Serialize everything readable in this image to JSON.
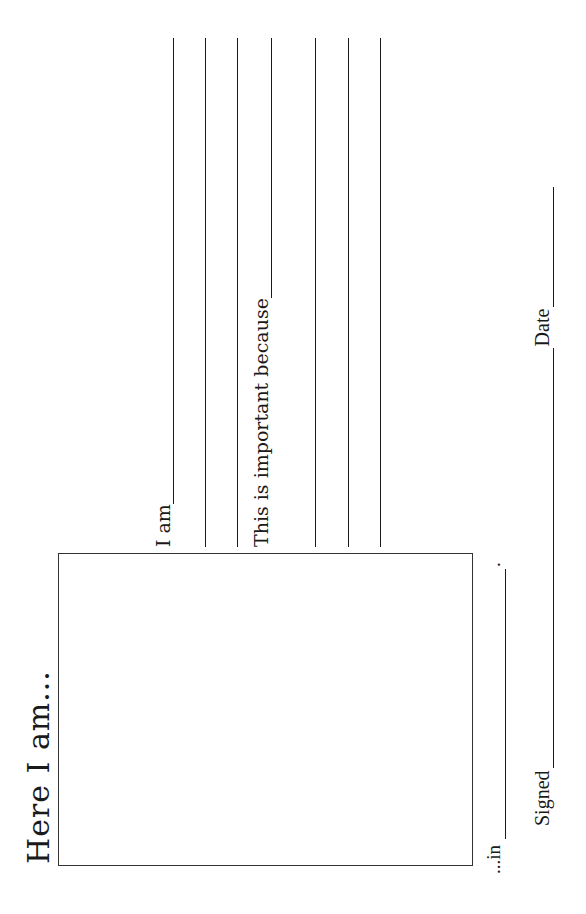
{
  "worksheet": {
    "title": "Here I am...",
    "photo_box": {
      "label": ""
    },
    "location_prompt": {
      "label": "...in",
      "terminator": "."
    },
    "i_am_prompt": {
      "label": "I am",
      "extra_lines": 2
    },
    "importance_prompt": {
      "label": "This is important because",
      "extra_lines": 3
    },
    "signature_row": {
      "signed_label": "Signed",
      "date_label": "Date"
    }
  },
  "colors": {
    "ink": "#1a1a1a",
    "paper": "#ffffff",
    "box_border": "#333333"
  }
}
